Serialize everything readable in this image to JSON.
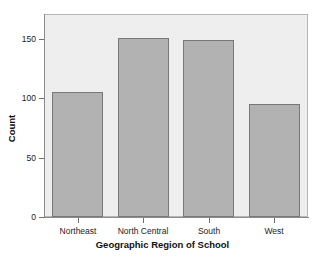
{
  "chart_data": {
    "type": "bar",
    "title": "",
    "xlabel": "Geographic Region of School",
    "ylabel": "Count",
    "categories": [
      "Northeast",
      "North Central",
      "South",
      "West"
    ],
    "values": [
      105,
      151,
      149,
      95
    ],
    "ylim": [
      0,
      170
    ],
    "yticks": [
      0,
      50,
      100,
      150
    ],
    "ytick_labels": [
      "0",
      "50",
      "100",
      "150"
    ],
    "grid": false,
    "legend": null,
    "colors": {
      "bar_fill": "#b2b2b2",
      "bar_border": "#787878",
      "panel_background": "#eeeeee",
      "panel_border": "#b6b6b6",
      "axis_line": "#8c8c8c",
      "text": "#1b1b1b",
      "figure_background": "#ffffff"
    }
  }
}
